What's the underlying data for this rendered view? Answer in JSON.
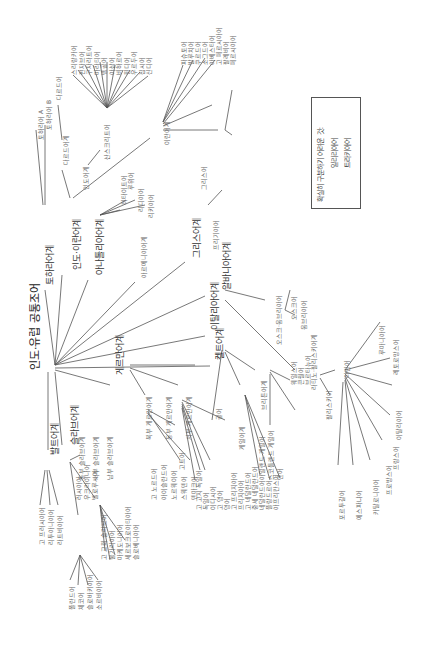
{
  "title": "인도·유럽 공통조어",
  "legend": {
    "heading": "확실히 구분하기 어려운 것:",
    "items": [
      "일리리아어",
      "트라키아어"
    ]
  },
  "nodes": [
    {
      "id": "root",
      "label": "인도·유럽 공통조어",
      "x": 30,
      "y": 370,
      "cls": "root"
    },
    {
      "id": "tochar",
      "label": "토하라어계",
      "x": 45,
      "y": 285,
      "cls": "big"
    },
    {
      "id": "tochA",
      "label": "토하라어 A",
      "x": 37,
      "y": 140
    },
    {
      "id": "tochB",
      "label": "토하라어 B",
      "x": 45,
      "y": 130
    },
    {
      "id": "indoiran",
      "label": "인도·이란어계",
      "x": 72,
      "y": 270,
      "cls": "big"
    },
    {
      "id": "dard",
      "label": "다르드어계",
      "x": 62,
      "y": 165
    },
    {
      "id": "dardic",
      "label": "다르드어",
      "x": 55,
      "y": 100
    },
    {
      "id": "indic",
      "label": "인도어계",
      "x": 82,
      "y": 190
    },
    {
      "id": "sanskrit",
      "label": "산스크리트어",
      "x": 103,
      "y": 160
    },
    {
      "id": "iranian",
      "label": "이란어계",
      "x": 163,
      "y": 145
    },
    {
      "id": "anatolian",
      "label": "아나톨리아어계",
      "x": 95,
      "y": 275,
      "cls": "big"
    },
    {
      "id": "hittite",
      "label": "히타이트어",
      "x": 120,
      "y": 205
    },
    {
      "id": "luwian",
      "label": "루위어",
      "x": 127,
      "y": 190
    },
    {
      "id": "lydian",
      "label": "리디아어",
      "x": 137,
      "y": 212
    },
    {
      "id": "lycian",
      "label": "리키아어",
      "x": 147,
      "y": 218
    },
    {
      "id": "armenian",
      "label": "아르메니아어계",
      "x": 140,
      "y": 278
    },
    {
      "id": "greek",
      "label": "그리스어계",
      "x": 192,
      "y": 258,
      "cls": "big"
    },
    {
      "id": "greekL",
      "label": "그리스어",
      "x": 200,
      "y": 190
    },
    {
      "id": "phryg",
      "label": "프리기아어",
      "x": 212,
      "y": 250
    },
    {
      "id": "albanian",
      "label": "알바니아어계",
      "x": 222,
      "y": 290,
      "cls": "big"
    },
    {
      "id": "italic",
      "label": "이탈리아어계",
      "x": 210,
      "y": 330,
      "cls": "big"
    },
    {
      "id": "osco",
      "label": "오스크·움브리아어",
      "x": 275,
      "y": 345
    },
    {
      "id": "oscan",
      "label": "오스크어",
      "x": 290,
      "y": 320
    },
    {
      "id": "umbrian",
      "label": "움브리아어",
      "x": 300,
      "y": 330
    },
    {
      "id": "latfal",
      "label": "라티노·팔리스키어계",
      "x": 310,
      "y": 390
    },
    {
      "id": "latin",
      "label": "라틴어",
      "x": 343,
      "y": 378
    },
    {
      "id": "faliscan",
      "label": "팔리스키어",
      "x": 325,
      "y": 420
    },
    {
      "id": "celtic",
      "label": "켈트어계",
      "x": 215,
      "y": 360,
      "cls": "big"
    },
    {
      "id": "gaulish",
      "label": "골어",
      "x": 215,
      "y": 420
    },
    {
      "id": "brythonic",
      "label": "브리튼어계",
      "x": 260,
      "y": 410
    },
    {
      "id": "goidelic",
      "label": "게일어계",
      "x": 238,
      "y": 450
    },
    {
      "id": "germanic",
      "label": "게르만어계",
      "x": 115,
      "y": 375,
      "cls": "big"
    },
    {
      "id": "balto",
      "label": "발트어계",
      "x": 50,
      "y": 455,
      "cls": "big"
    },
    {
      "id": "slavic",
      "label": "슬라브어계",
      "x": 70,
      "y": 445,
      "cls": "big"
    }
  ],
  "leaf_groups": {
    "indic_langs": [
      "스리랑카어",
      "펀자브어",
      "구자라트어",
      "마라티어",
      "벵골어",
      "아삼어",
      "비하르어",
      "힌디어",
      "우르두어",
      "집시어",
      "신디어"
    ],
    "iranian_langs": [
      "파슈토어",
      "발루치어",
      "쿠르드어",
      "소그드어",
      "아베스타어",
      "고 페르시아어",
      "팔레비어",
      "페르시아어"
    ],
    "romance_langs": [
      "루마니아어",
      "레토로망스어",
      "이탈리아어",
      "프랑스어",
      "프로방스어",
      "카탈로니아어",
      "에스파냐어",
      "포르투갈어"
    ],
    "brythonic_langs": [
      "웨일스어",
      "콘월어",
      "브르타뉴어"
    ],
    "goidelic_langs": [
      "아일랜드 게일어",
      "스코틀랜드 게일어",
      "맨어"
    ],
    "germanic_branches": [
      "북부 게르만어계",
      "동부 게르만어계",
      "서부 게르만어계"
    ],
    "north_germanic": [
      "고 노르드어",
      "아이슬란드어",
      "노르웨이어",
      "스웨덴어",
      "덴마크어"
    ],
    "east_germanic": [
      "고트어"
    ],
    "west_germanic": [
      "고 고지 독일어",
      "독일어",
      "이디시어",
      "고 영어",
      "영어",
      "고 프리지아어",
      "프리지아어",
      "고 네덜란드어",
      "중세 네덜란드어",
      "네덜란드어",
      "플랑드르어",
      "아프리칸스어"
    ],
    "baltic_langs": [
      "고 프러시아어",
      "리투아니아어",
      "라트비아어"
    ],
    "slavic_branches": [
      "동부 슬라브어계",
      "서부 슬라브어계",
      "남부 슬라브어계"
    ],
    "east_slavic": [
      "러시아어",
      "우크라이나어",
      "벨로루시어"
    ],
    "west_slavic": [
      "폴란드어",
      "체코어",
      "슬로바키아어",
      "소르비아어"
    ],
    "south_slavic": [
      "고 교회 슬라브어",
      "불가리아어",
      "마케도니아어",
      "세르보크로아티아어",
      "슬로베니아어"
    ]
  }
}
